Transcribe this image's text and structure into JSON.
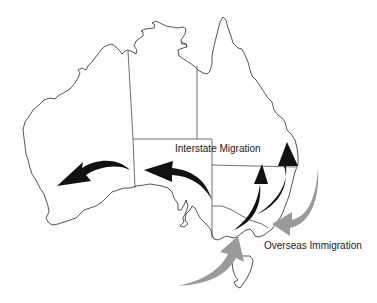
{
  "figure": {
    "labels": {
      "interstate": "Interstate Migration",
      "overseas": "Overseas Immigration"
    },
    "colors": {
      "interstate_arrows": "#111111",
      "overseas_arrows": "#9a9a9a",
      "coastline": "#2a2a2a",
      "background": "#ffffff"
    },
    "arrows": {
      "interstate": [
        {
          "from": "South Australia",
          "to": "Western Australia",
          "direction": "westward"
        },
        {
          "from": "Victoria / New South Wales border",
          "to": "South Australia",
          "direction": "westward"
        },
        {
          "from": "Victoria",
          "to": "Queensland",
          "direction": "northward"
        },
        {
          "from": "Victoria",
          "to": "Queensland (coast)",
          "direction": "northward"
        }
      ],
      "overseas": [
        {
          "from": "offshore east",
          "to": "Sydney / NSW coast",
          "direction": "inward"
        },
        {
          "from": "offshore south",
          "to": "Melbourne / Victoria",
          "direction": "inward"
        }
      ]
    }
  }
}
